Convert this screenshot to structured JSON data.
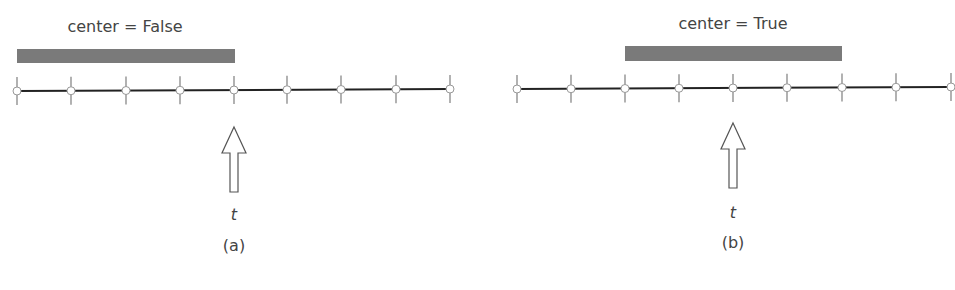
{
  "panels": [
    {
      "id": "a",
      "title": "center = False",
      "caption": "(a)",
      "time_label": "t",
      "nodes_x": [
        17,
        71,
        126,
        180,
        234,
        287,
        341,
        396,
        450
      ],
      "line_y": 90,
      "window": {
        "x1": 17,
        "x2": 235,
        "y": 49,
        "h": 14
      },
      "arrow_x": 234,
      "title_x": 125,
      "title_y": 17,
      "t_y": 205,
      "caption_y": 236,
      "arrow_top": 127
    },
    {
      "id": "b",
      "title": "center = True",
      "caption": "(b)",
      "time_label": "t",
      "nodes_x": [
        517,
        571,
        625,
        679,
        733,
        787,
        842,
        896,
        951
      ],
      "line_y": 88,
      "window": {
        "x1": 625,
        "x2": 842,
        "y": 46,
        "h": 15
      },
      "arrow_x": 733,
      "title_x": 733,
      "title_y": 14,
      "t_y": 203,
      "caption_y": 233,
      "arrow_top": 123
    }
  ],
  "colors": {
    "window": "#7a7a7a",
    "line": "#222222",
    "tick": "#888888",
    "node_fill": "#ffffff",
    "node_stroke": "#999999"
  }
}
